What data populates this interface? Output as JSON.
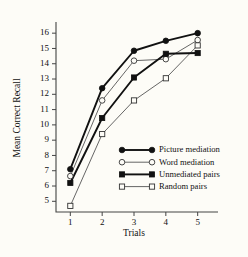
{
  "chart_data": {
    "type": "line",
    "title": "",
    "xlabel": "Trials",
    "ylabel": "Mean Correct Recall",
    "x": [
      1,
      2,
      3,
      4,
      5
    ],
    "xtick_labels": [
      "1",
      "2",
      "3",
      "4",
      "5"
    ],
    "ytick_labels": [
      "5",
      "6",
      "7",
      "8",
      "9",
      "10",
      "11",
      "12",
      "13",
      "14",
      "15",
      "16"
    ],
    "ytick_values": [
      5,
      6,
      7,
      8,
      9,
      10,
      11,
      12,
      13,
      14,
      15,
      16
    ],
    "xlim": [
      0.55,
      5.45
    ],
    "ylim": [
      4.3,
      16.6
    ],
    "grid": false,
    "legend_position": "inside-lower-right",
    "series": [
      {
        "name": "Picture mediation",
        "marker": "filled-circle",
        "line": "thick",
        "color": "#111111",
        "values": [
          7.1,
          12.4,
          14.85,
          15.5,
          16.0
        ]
      },
      {
        "name": "Word mediation",
        "marker": "open-circle",
        "line": "thin",
        "color": "#555555",
        "values": [
          6.65,
          11.6,
          14.2,
          14.3,
          15.55
        ]
      },
      {
        "name": "Unmediated pairs",
        "marker": "filled-square",
        "line": "thick",
        "color": "#111111",
        "values": [
          6.2,
          10.45,
          13.1,
          14.65,
          14.7
        ]
      },
      {
        "name": "Random pairs",
        "marker": "open-square",
        "line": "thin",
        "color": "#555555",
        "values": [
          4.7,
          9.4,
          11.6,
          13.05,
          15.2
        ]
      }
    ]
  }
}
